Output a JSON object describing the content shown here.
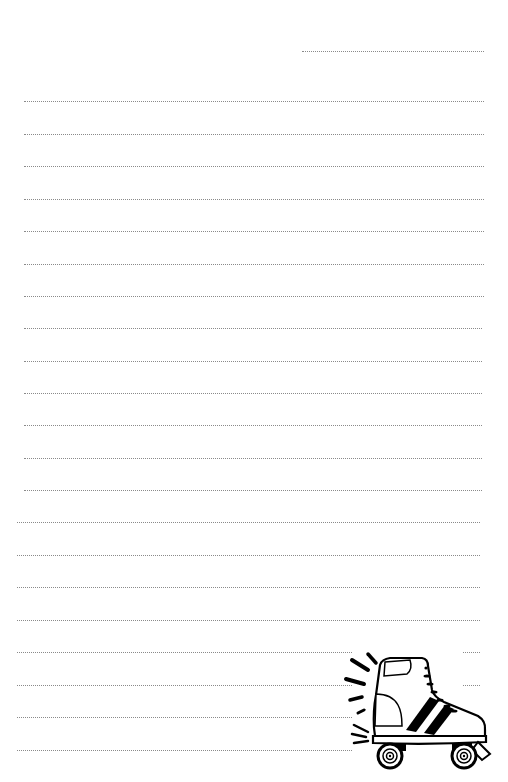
{
  "page": {
    "type": "lined-notepaper",
    "background": "#ffffff",
    "rule_color": "#8a8a8a",
    "rule_style": "dotted"
  },
  "header_rule": {
    "x1": 302,
    "x2": 484,
    "y": 51
  },
  "rules": [
    {
      "x1": 24,
      "x2": 484,
      "y": 101
    },
    {
      "x1": 24,
      "x2": 484,
      "y": 134
    },
    {
      "x1": 24,
      "x2": 484,
      "y": 166
    },
    {
      "x1": 24,
      "x2": 484,
      "y": 199
    },
    {
      "x1": 24,
      "x2": 484,
      "y": 231
    },
    {
      "x1": 24,
      "x2": 484,
      "y": 264
    },
    {
      "x1": 24,
      "x2": 484,
      "y": 296
    },
    {
      "x1": 24,
      "x2": 482,
      "y": 328
    },
    {
      "x1": 24,
      "x2": 482,
      "y": 361
    },
    {
      "x1": 24,
      "x2": 482,
      "y": 393
    },
    {
      "x1": 24,
      "x2": 482,
      "y": 425
    },
    {
      "x1": 24,
      "x2": 482,
      "y": 458
    },
    {
      "x1": 24,
      "x2": 482,
      "y": 490
    },
    {
      "x1": 17,
      "x2": 480,
      "y": 522
    },
    {
      "x1": 17,
      "x2": 480,
      "y": 555
    },
    {
      "x1": 17,
      "x2": 480,
      "y": 587
    },
    {
      "x1": 17,
      "x2": 480,
      "y": 620
    },
    {
      "x1": 17,
      "x2": 480,
      "y": 652
    },
    {
      "x1": 17,
      "x2": 480,
      "y": 685
    },
    {
      "x1": 17,
      "x2": 480,
      "y": 717
    },
    {
      "x1": 17,
      "x2": 480,
      "y": 750
    }
  ],
  "illustration": {
    "name": "roller-skate",
    "position": "bottom-right",
    "colors": {
      "stroke": "#000000",
      "fill": "#ffffff"
    }
  }
}
